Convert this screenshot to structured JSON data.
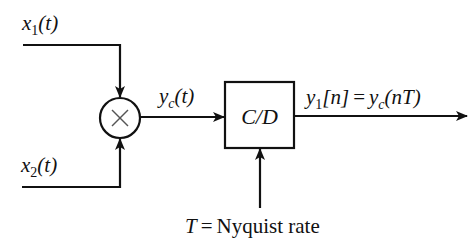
{
  "diagram": {
    "type": "block-diagram",
    "colors": {
      "stroke": "#111111",
      "background": "#ffffff"
    },
    "inputs": [
      {
        "id": "x1",
        "var": "x",
        "sub": "1",
        "arg": "(t)"
      },
      {
        "id": "x2",
        "var": "x",
        "sub": "2",
        "arg": "(t)"
      }
    ],
    "multiplier": {
      "symbol": "×"
    },
    "intermediate": {
      "var": "y",
      "sub": "c",
      "arg": "(t)"
    },
    "converter": {
      "label": "C/D"
    },
    "output": {
      "lhs_var": "y",
      "lhs_sub": "1",
      "lhs_arg": "[n]",
      "eq": "=",
      "rhs_var": "y",
      "rhs_sub": "c",
      "rhs_arg": "(nT)"
    },
    "sampling": {
      "var": "T",
      "eq": "=",
      "text": "Nyquist rate"
    }
  }
}
